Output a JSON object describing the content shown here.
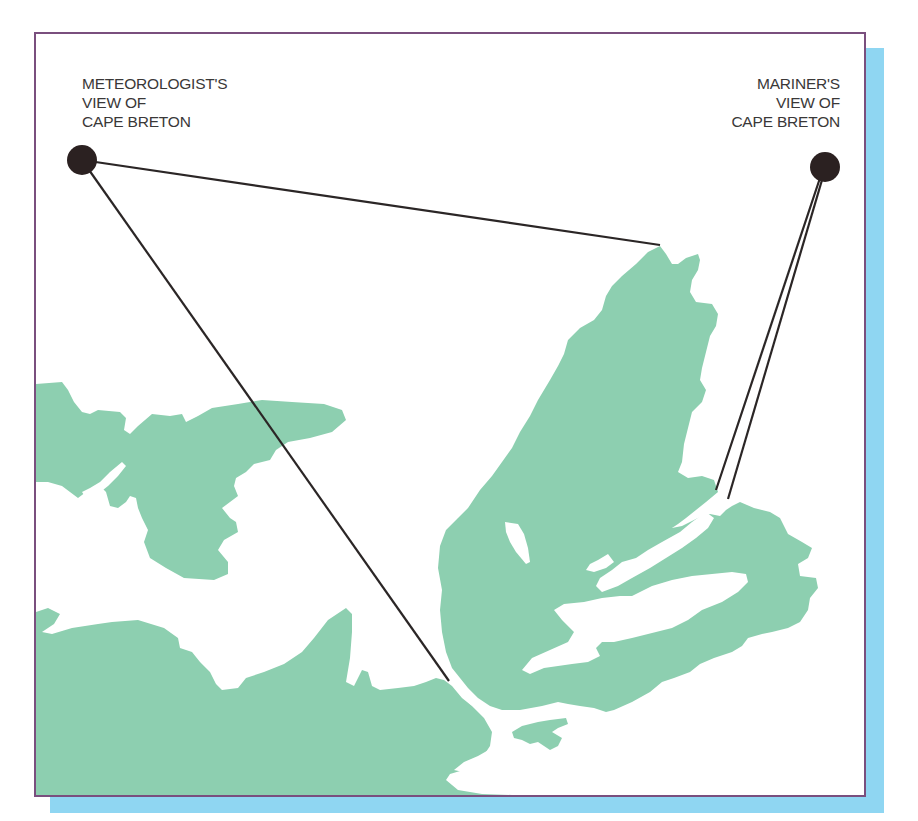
{
  "figure": {
    "colors": {
      "land": "#8dcfb0",
      "water": "#ffffff",
      "frame_border": "#7a4f7e",
      "shadow": "#8fd6f2",
      "sight_line": "#2b2626",
      "viewpoint": "#2b2121"
    }
  },
  "viewpoints": {
    "meteorologist": {
      "line1": "METEOROLOGIST'S",
      "line2": "VIEW OF",
      "line3": "CAPE BRETON",
      "dot": {
        "x": 80,
        "y": 158,
        "r": 15
      }
    },
    "mariner": {
      "line1": "MARINER'S",
      "line2": "VIEW OF",
      "line3": "CAPE BRETON",
      "dot": {
        "x": 823,
        "y": 165,
        "r": 15
      }
    }
  },
  "sight_lines": [
    {
      "from": "meteorologist",
      "to": [
        658,
        243
      ]
    },
    {
      "from": "meteorologist",
      "to": [
        447,
        679
      ]
    },
    {
      "from": "mariner",
      "to": [
        714,
        488
      ]
    },
    {
      "from": "mariner",
      "to": [
        726,
        497
      ]
    }
  ],
  "map_regions": [
    "Cape Breton Island",
    "Prince Edward Island",
    "Nova Scotia mainland"
  ]
}
